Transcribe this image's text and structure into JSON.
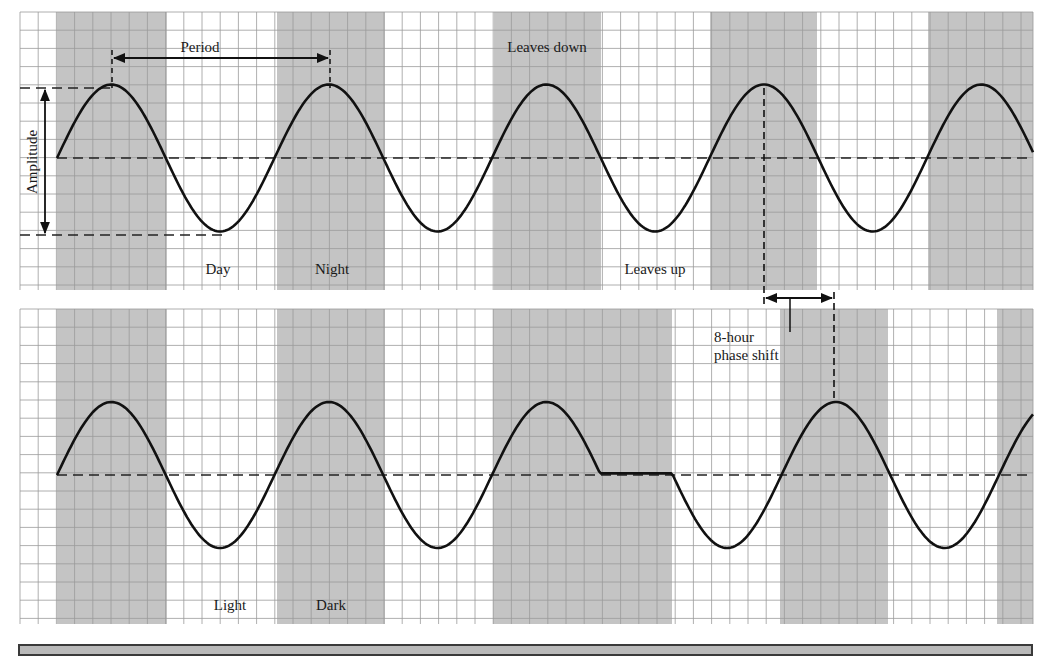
{
  "figure": {
    "colors": {
      "background": "#ffffff",
      "grid_line": "#9a9a9a",
      "band_fill": "#c4c4c4",
      "curve": "#111111",
      "dashed": "#222222",
      "footer_fill": "#b9b9b9"
    },
    "grid": {
      "cell_px": 18.2,
      "x_start": 20,
      "x_end": 1033
    },
    "top_panel": {
      "name": "leaf-movement-rhythm",
      "y_top": 12,
      "y_bottom": 290,
      "peak_y": 88,
      "mid_y": 158,
      "trough_y": 235,
      "curve_start_x": 57,
      "period_px": 217.5,
      "dark_bands": [
        [
          57,
          167
        ],
        [
          277,
          385
        ],
        [
          494,
          601
        ],
        [
          710,
          817
        ],
        [
          928,
          1033
        ]
      ],
      "labels": {
        "period": "Period",
        "amplitude": "Amplitude",
        "leaves_down": "Leaves down",
        "leaves_up": "Leaves up",
        "day": "Day",
        "night": "Night"
      }
    },
    "bottom_panel": {
      "name": "shifted-rhythm",
      "y_top": 309,
      "y_bottom": 624,
      "peak_y": 403,
      "mid_y": 475,
      "trough_y": 549,
      "curve_start_x": 57,
      "period_px": 217.5,
      "pause": {
        "start_x": 600,
        "end_x": 672
      },
      "dark_bands": [
        [
          57,
          167
        ],
        [
          277,
          385
        ],
        [
          493,
          672
        ],
        [
          780,
          888
        ],
        [
          997,
          1033
        ]
      ],
      "labels": {
        "light": "Light",
        "dark": "Dark",
        "phase_shift_line1": "8-hour",
        "phase_shift_line2": "phase shift"
      }
    },
    "annotations": {
      "period_arrow": {
        "x1": 112,
        "x2": 330,
        "y": 58
      },
      "amplitude_arrow": {
        "x": 45,
        "y1": 88,
        "y2": 235
      },
      "phase_arrow": {
        "x1": 764,
        "x2": 834,
        "y": 298
      }
    }
  }
}
